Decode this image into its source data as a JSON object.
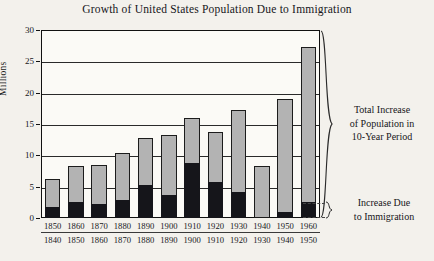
{
  "chart_data": {
    "type": "bar",
    "title": "Growth of United States Population Due to Immigration",
    "xlabel": "",
    "ylabel": "Millions",
    "ylim": [
      0,
      30
    ],
    "yticks": [
      0,
      5,
      10,
      15,
      20,
      25,
      30
    ],
    "grid": true,
    "legend_position": "right-annotations",
    "categories": [
      "1840–1850",
      "1850–1860",
      "1860–1870",
      "1870–1880",
      "1880–1890",
      "1890–1900",
      "1900–1910",
      "1910–1920",
      "1920–1930",
      "1930–1940",
      "1940–1950",
      "1950–1960"
    ],
    "decade_end_labels": [
      "1850",
      "1860",
      "1870",
      "1880",
      "1890",
      "1900",
      "1910",
      "1920",
      "1930",
      "1940",
      "1950",
      "1960"
    ],
    "decade_start_labels": [
      "1840",
      "1850",
      "1860",
      "1870",
      "1880",
      "1890",
      "1900",
      "1910",
      "1920",
      "1930",
      "1940",
      "1950"
    ],
    "series": [
      {
        "name": "Total Increase of Population in 10-Year Period",
        "values": [
          6.2,
          8.3,
          8.4,
          10.4,
          12.8,
          13.2,
          16.0,
          13.8,
          17.2,
          8.3,
          19.0,
          27.3
        ]
      },
      {
        "name": "Increase Due to Immigration",
        "values": [
          1.7,
          2.6,
          2.3,
          2.8,
          5.2,
          3.7,
          8.8,
          5.7,
          4.1,
          0.0,
          1.0,
          2.5
        ]
      }
    ],
    "annotations": [
      "Total Increase of Population in 10-Year Period",
      "Increase Due to Immigration"
    ]
  },
  "annotations": {
    "total_line1": "Total Increase",
    "total_line2": "of Population in",
    "total_line3": "10-Year Period",
    "immigration_line1": "Increase Due",
    "immigration_line2": "to Immigration"
  }
}
